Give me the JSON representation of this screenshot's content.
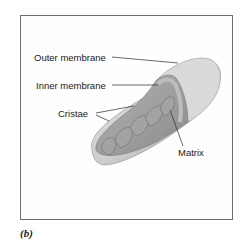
{
  "figure": {
    "caption": "(b)",
    "labels": {
      "outer_membrane": "Outer membrane",
      "inner_membrane": "Inner membrane",
      "cristae": "Cristae",
      "matrix": "Matrix"
    },
    "colors": {
      "frame": "#6e6e6e",
      "outer_shell": "#c4c4c4",
      "inner_fold": "#9a9a9a",
      "leader_line": "#2a2a2a"
    }
  }
}
